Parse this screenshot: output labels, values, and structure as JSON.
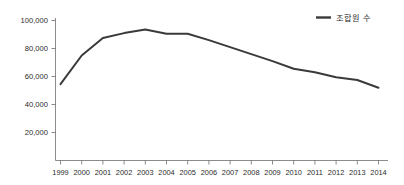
{
  "chart_data": {
    "type": "line",
    "title": "",
    "subtitle": "",
    "xlabel": "",
    "ylabel": "",
    "categories": [
      "1999",
      "2000",
      "2001",
      "2002",
      "2003",
      "2004",
      "2005",
      "2006",
      "2007",
      "2008",
      "2009",
      "2010",
      "2011",
      "2012",
      "2013",
      "2014"
    ],
    "series": [
      {
        "name": "조합원 수",
        "color": "#3a3a3a",
        "values": [
          54500,
          75000,
          87500,
          91000,
          93500,
          90500,
          90500,
          86000,
          81000,
          76000,
          71000,
          65500,
          63000,
          59500,
          57500,
          52000
        ]
      }
    ],
    "ylim": [
      0,
      100000
    ],
    "yticks": [
      20000,
      40000,
      60000,
      80000,
      100000
    ],
    "ytick_labels": [
      "20,000",
      "40,000",
      "60,000",
      "80,000",
      "100,000"
    ],
    "xtick_labels": [
      "1999",
      "2000",
      "2001",
      "2002",
      "2003",
      "2004",
      "2005",
      "2006",
      "2007",
      "2008",
      "2009",
      "2010",
      "2011",
      "2012",
      "2013",
      "2014"
    ],
    "grid": false,
    "legend_position": "top-right",
    "legend_entries": [
      "조합원 수"
    ],
    "axis_color": "#6e6e6e",
    "text_color": "#2b2b2b",
    "background": "#ffffff"
  },
  "legend": {
    "items": [
      {
        "label": "조합원 수",
        "color": "#3a3a3a"
      }
    ]
  }
}
